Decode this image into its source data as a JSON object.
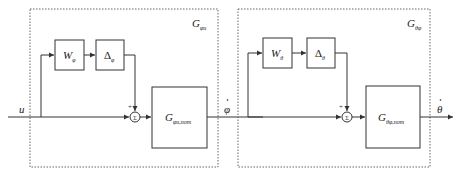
{
  "diagram": {
    "type": "block-diagram",
    "input": {
      "label": "u"
    },
    "intermediate": {
      "label": "φ̇",
      "base": "φ"
    },
    "output": {
      "label": "θ̇",
      "base": "θ"
    },
    "subsystems": [
      {
        "name": "G_φu",
        "label_main": "G",
        "label_sub": "φu",
        "weight": {
          "main": "W",
          "sub": "φ"
        },
        "uncertainty": {
          "main": "Δ",
          "sub": "φ"
        },
        "summing_junction": {
          "symbol": "Σ",
          "sign_top": "+",
          "sign_left": "+"
        },
        "nominal": {
          "main": "G",
          "sub": "φu,nom"
        }
      },
      {
        "name": "G_θφ",
        "label_main": "G",
        "label_sub": "θφ",
        "weight": {
          "main": "W",
          "sub": "θ"
        },
        "uncertainty": {
          "main": "Δ",
          "sub": "θ"
        },
        "summing_junction": {
          "symbol": "Σ",
          "sign_top": "+",
          "sign_left": "+"
        },
        "nominal": {
          "main": "G",
          "sub": "θφ,nom"
        }
      }
    ],
    "colors": {
      "line": "#333333",
      "dashed": "#666666",
      "background": "#ffffff"
    }
  }
}
